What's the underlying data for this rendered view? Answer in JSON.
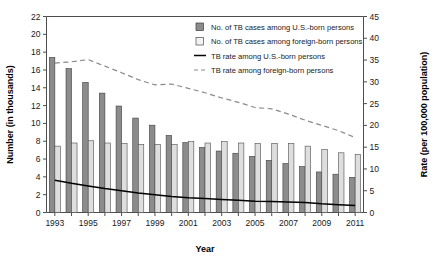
{
  "chart_data": {
    "type": "bar",
    "title": "",
    "subtitle": "",
    "xlabel": "Year",
    "ylabel": "Number (in thousands)",
    "y2label": "Rate (per 100,000 population)",
    "grid": false,
    "legend_position": "top-right",
    "categories": [
      1993,
      1994,
      1995,
      1996,
      1997,
      1998,
      1999,
      2000,
      2001,
      2002,
      2003,
      2004,
      2005,
      2006,
      2007,
      2008,
      2009,
      2010,
      2011
    ],
    "tick_labels_x": [
      "1993",
      "",
      "1995",
      "",
      "1997",
      "",
      "1999",
      "",
      "2001",
      "",
      "2003",
      "",
      "2005",
      "",
      "2007",
      "",
      "2009",
      "",
      "2011"
    ],
    "ylim": [
      0,
      22
    ],
    "yticks": [
      0,
      2,
      4,
      6,
      8,
      10,
      12,
      14,
      16,
      18,
      20,
      22
    ],
    "ytick_labels": [
      "0",
      "2",
      "4",
      "6",
      "8",
      "10",
      "12",
      "14",
      "16",
      "18",
      "20",
      "22"
    ],
    "y2lim": [
      0,
      45
    ],
    "y2ticks": [
      0,
      5,
      10,
      15,
      20,
      25,
      30,
      35,
      40,
      45
    ],
    "y2tick_labels": [
      "0",
      "5",
      "10",
      "15",
      "20",
      "25",
      "30",
      "35",
      "40",
      "45"
    ],
    "series": [
      {
        "name": "No. of TB cases among U.S.-born persons",
        "type": "bar",
        "axis": "left",
        "color": "#8c8c8c",
        "values": [
          17.4,
          16.15,
          14.6,
          13.4,
          11.95,
          10.6,
          9.8,
          8.65,
          7.85,
          7.3,
          6.9,
          6.65,
          6.3,
          5.85,
          5.5,
          5.15,
          4.55,
          4.3,
          3.95
        ]
      },
      {
        "name": "No. of TB cases among foreign-born persons",
        "type": "bar",
        "axis": "left",
        "color": "#dedede",
        "values": [
          7.45,
          7.8,
          8.05,
          7.8,
          7.75,
          7.65,
          7.65,
          7.65,
          7.95,
          7.8,
          7.95,
          7.8,
          7.75,
          7.75,
          7.75,
          7.45,
          7.05,
          6.7,
          6.5
        ]
      },
      {
        "name": "TB rate among U.S.-born persons",
        "type": "line",
        "axis": "right",
        "color": "#000000",
        "style": "solid",
        "values": [
          7.4,
          6.7,
          6.1,
          5.5,
          5.0,
          4.5,
          4.1,
          3.7,
          3.4,
          3.2,
          3.0,
          2.8,
          2.6,
          2.5,
          2.4,
          2.3,
          2.0,
          1.8,
          1.6
        ]
      },
      {
        "name": "TB rate among foreign-born persons",
        "type": "line",
        "axis": "right",
        "color": "#8a8a8a",
        "style": "dashed",
        "values": [
          34.3,
          34.6,
          35.1,
          33.6,
          32.1,
          30.5,
          29.3,
          29.5,
          28.5,
          27.5,
          26.3,
          25.3,
          24.1,
          23.8,
          22.6,
          21.2,
          20.0,
          18.8,
          17.2
        ]
      }
    ],
    "legend": [
      {
        "label": "No. of TB cases among U.S.-born persons",
        "marker": "square-filled",
        "color": "#8c8c8c"
      },
      {
        "label": "No. of TB cases among foreign-born persons",
        "marker": "square-open",
        "color": "#dedede"
      },
      {
        "label": "TB rate among U.S.-born persons",
        "marker": "line-solid",
        "color": "#000000"
      },
      {
        "label": "TB rate among foreign-born persons",
        "marker": "line-dashed",
        "color": "#8a8a8a"
      }
    ]
  }
}
